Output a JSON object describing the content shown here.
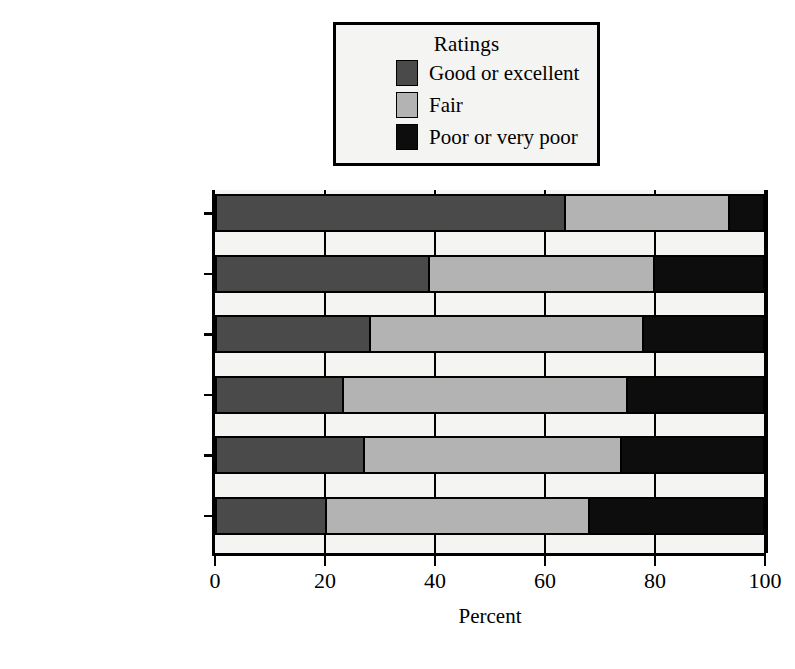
{
  "legend": {
    "title": "Ratings",
    "entries": [
      {
        "label": "Good or excellent",
        "color": "#4a4a4a",
        "icon": "legend-swatch-good"
      },
      {
        "label": "Fair",
        "color": "#b3b3b3",
        "icon": "legend-swatch-fair"
      },
      {
        "label": "Poor or very poor",
        "color": "#0d0d0d",
        "icon": "legend-swatch-poor"
      }
    ]
  },
  "axis": {
    "x_title": "Percent",
    "x_ticks": [
      "0",
      "20",
      "40",
      "60",
      "80",
      "100"
    ]
  },
  "chart_data": {
    "type": "bar",
    "orientation": "horizontal",
    "stacked": true,
    "stack_total": 100,
    "title": "",
    "xlabel": "Percent",
    "ylabel": "",
    "xlim": [
      0,
      100
    ],
    "xticks": [
      0,
      20,
      40,
      60,
      80,
      100
    ],
    "grid": true,
    "legend_position": "top-center",
    "legend_title": "Ratings",
    "categories": [
      "Police",
      "Prison service",
      "Magistrates",
      "CPS",
      "Probation service",
      "Judges"
    ],
    "series": [
      {
        "name": "Good or excellent",
        "color": "#4a4a4a",
        "values": [
          64,
          39,
          28,
          23,
          27,
          20
        ]
      },
      {
        "name": "Fair",
        "color": "#b3b3b3",
        "values": [
          30,
          41,
          50,
          52,
          47,
          48
        ]
      },
      {
        "name": "Poor or very poor",
        "color": "#0d0d0d",
        "values": [
          6,
          20,
          22,
          25,
          26,
          32
        ]
      }
    ]
  }
}
